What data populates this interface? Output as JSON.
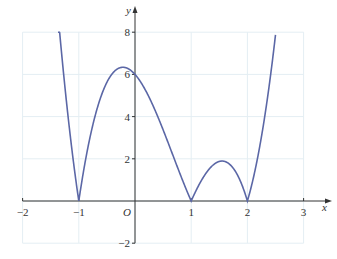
{
  "chart_data": {
    "type": "line",
    "title": "",
    "xlabel": "x",
    "ylabel": "y",
    "origin_label": "O",
    "xlim": [
      -2,
      3
    ],
    "ylim": [
      -2,
      8
    ],
    "grid": true,
    "xticks": [
      -2,
      -1,
      1,
      2,
      3
    ],
    "xtick_labels": [
      "−2",
      "−1",
      "1",
      "2",
      "3"
    ],
    "yticks": [
      -2,
      2,
      4,
      6,
      8
    ],
    "ytick_labels": [
      "−2",
      "2",
      "4",
      "6",
      "8"
    ],
    "series": [
      {
        "name": "y = 3|(x+1)(x−1)(x−2)|",
        "color": "#5b67a6",
        "x": [
          -1.37,
          -1.25,
          -1.0,
          -0.75,
          -0.5,
          -0.4,
          -0.25,
          0,
          0.25,
          0.5,
          0.75,
          1.0,
          1.25,
          1.5,
          1.75,
          2.0,
          2.25,
          2.5
        ],
        "y": [
          8.0,
          5.3,
          0,
          2.6,
          5.6,
          6.05,
          5.9,
          6.0,
          5.0,
          3.4,
          1.5,
          0,
          1.4,
          1.9,
          1.4,
          0,
          2.5,
          7.9
        ]
      }
    ],
    "zeros": [
      -1,
      1,
      2
    ],
    "y_intercept": 6,
    "colors": {
      "curve": "#5b67a6",
      "axis": "#333333",
      "grid": "#e4eef3"
    }
  }
}
